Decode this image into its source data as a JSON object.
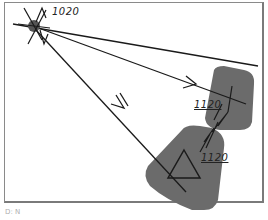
{
  "diagram": {
    "colors": {
      "background": "#ffffff",
      "frame": "#8a8a8a",
      "zone_fill": "#6b6b6b",
      "line": "#1a1a1a",
      "origin_marker": "#555555"
    },
    "origin": {
      "label": "1020",
      "icon": "compass-star-icon"
    },
    "targets": [
      {
        "label": "1120",
        "shape": "rounded-square-zone",
        "marker": "crosshair"
      },
      {
        "label": "1120",
        "shape": "pentagon-zone",
        "marker": "triangle"
      }
    ],
    "caption": "D: N"
  }
}
